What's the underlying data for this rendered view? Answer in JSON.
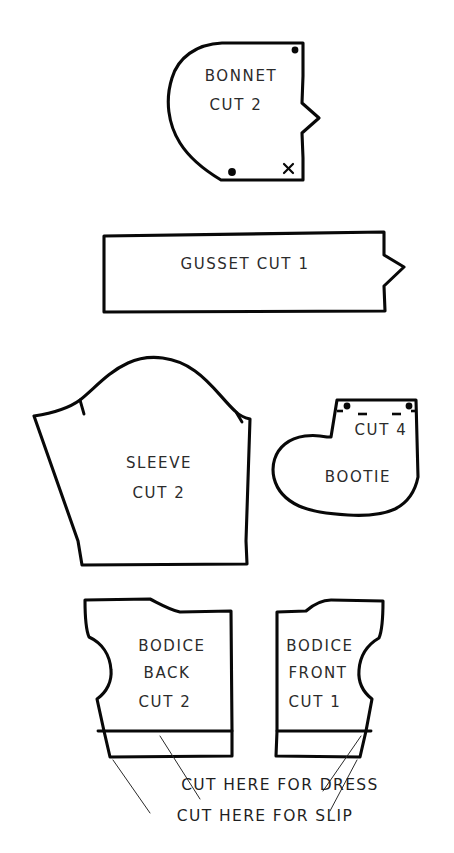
{
  "sheet": {
    "title": "Baby Layette Pattern Pieces",
    "background_color": "#ffffff",
    "ink_color": "#080808",
    "text_color": "#2b2b2b"
  },
  "pieces": [
    {
      "id": "bonnet",
      "name": "Bonnet",
      "label_lines": [
        "BONNET",
        "CUT 2"
      ],
      "line1": "BONNET",
      "line2": "CUT 2",
      "markings": {
        "dots": 2,
        "x_marks": 1,
        "notches": 1
      }
    },
    {
      "id": "gusset",
      "name": "Gusset",
      "label_lines": [
        "GUSSET CUT 1"
      ],
      "line1": "GUSSET CUT 1",
      "markings": {
        "dots": 0,
        "x_marks": 0,
        "notches": 1
      }
    },
    {
      "id": "sleeve",
      "name": "Sleeve",
      "label_lines": [
        "SLEEVE",
        "CUT 2"
      ],
      "line1": "SLEEVE",
      "line2": "CUT 2",
      "markings": {
        "dots": 0,
        "x_marks": 0,
        "notches": 2
      }
    },
    {
      "id": "bootie",
      "name": "Bootie",
      "label_lines": [
        "CUT 4",
        "BOOTIE"
      ],
      "line1": "CUT 4",
      "line2": "BOOTIE",
      "markings": {
        "dots": 2,
        "x_marks": 0,
        "notches": 2
      }
    },
    {
      "id": "bodice-back",
      "name": "Bodice Back",
      "label_lines": [
        "BODICE",
        "BACK",
        "CUT 2"
      ],
      "line1": "BODICE",
      "line2": "BACK",
      "line3": "CUT 2",
      "markings": {
        "dots": 0,
        "x_marks": 0,
        "notches": 0
      }
    },
    {
      "id": "bodice-front",
      "name": "Bodice Front",
      "label_lines": [
        "BODICE",
        "FRONT",
        "CUT 1"
      ],
      "line1": "BODICE",
      "line2": "FRONT",
      "line3": "CUT 1",
      "markings": {
        "dots": 0,
        "x_marks": 0,
        "notches": 0
      }
    }
  ],
  "captions": {
    "dress": "CUT HERE FOR DRESS",
    "slip": "CUT HERE FOR SLIP"
  }
}
